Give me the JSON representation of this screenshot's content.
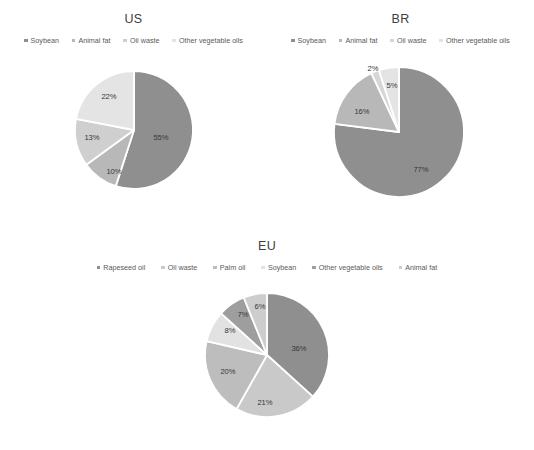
{
  "figure": {
    "background": "#ffffff",
    "palette": {
      "dark_gray": "#8f8f8f",
      "mid_gray": "#b0b0b0",
      "light_gray": "#c9c9c9",
      "lighter_gray": "#dedede",
      "lightest_gray": "#ececec",
      "pale_gray": "#bdbdbd",
      "separator": "#ffffff",
      "label_text": "#363636",
      "legend_text": "#5a5a5a",
      "title_text": "#404040"
    }
  },
  "chart_data": [
    {
      "type": "pie",
      "title": "US",
      "legend_position": "top",
      "categories": [
        "Soybean",
        "Animal fat",
        "Oil waste",
        "Other vegetable oils"
      ],
      "values": [
        55,
        10,
        13,
        22
      ],
      "labels": [
        "55%",
        "10%",
        "13%",
        "22%"
      ],
      "colors": [
        "#8f8f8f",
        "#b8b8b8",
        "#cfcfcf",
        "#e4e4e4"
      ],
      "xlabel": "",
      "ylabel": ""
    },
    {
      "type": "pie",
      "title": "BR",
      "legend_position": "top",
      "categories": [
        "Soybean",
        "Animal fat",
        "Oil waste",
        "Other vegetable oils"
      ],
      "values": [
        77,
        16,
        2,
        5
      ],
      "labels": [
        "77%",
        "16%",
        "2%",
        "5%"
      ],
      "colors": [
        "#8f8f8f",
        "#b8b8b8",
        "#d6d6d6",
        "#e4e4e4"
      ],
      "xlabel": "",
      "ylabel": ""
    },
    {
      "type": "pie",
      "title": "EU",
      "legend_position": "top",
      "categories": [
        "Rapeseed oil",
        "Oil waste",
        "Palm oil",
        "Soybean",
        "Other vegetable oils",
        "Animal fat"
      ],
      "values": [
        36,
        21,
        20,
        8,
        7,
        6
      ],
      "labels": [
        "36%",
        "21%",
        "20%",
        "8%",
        "7%",
        "6%"
      ],
      "colors": [
        "#8f8f8f",
        "#c9c9c9",
        "#bdbdbd",
        "#e2e2e2",
        "#9e9e9e",
        "#cdcdcd"
      ],
      "xlabel": "",
      "ylabel": ""
    }
  ],
  "panels": {
    "us": {
      "title": "US",
      "legend": [
        {
          "label": "Soybean",
          "color": "#8f8f8f"
        },
        {
          "label": "Animal fat",
          "color": "#b8b8b8"
        },
        {
          "label": "Oil waste",
          "color": "#cfcfcf"
        },
        {
          "label": "Other vegetable oils",
          "color": "#e4e4e4"
        }
      ],
      "slices": [
        {
          "name": "Soybean",
          "value": 55,
          "label": "55%",
          "color": "#8f8f8f",
          "label_x": 27,
          "label_y": 8
        },
        {
          "name": "Animal fat",
          "value": 10,
          "label": "10%",
          "color": "#b8b8b8",
          "label_x": -20,
          "label_y": 42
        },
        {
          "name": "Oil waste",
          "value": 13,
          "label": "13%",
          "color": "#cfcfcf",
          "label_x": -42,
          "label_y": 8
        },
        {
          "name": "Other vegetable oils",
          "value": 22,
          "label": "22%",
          "color": "#e4e4e4",
          "label_x": -25,
          "label_y": -33
        }
      ]
    },
    "br": {
      "title": "BR",
      "legend": [
        {
          "label": "Soybean",
          "color": "#8f8f8f"
        },
        {
          "label": "Animal fat",
          "color": "#b8b8b8"
        },
        {
          "label": "Oil waste",
          "color": "#d6d6d6"
        },
        {
          "label": "Other vegetable oils",
          "color": "#e4e4e4"
        }
      ],
      "slices": [
        {
          "name": "Soybean",
          "value": 77,
          "label": "77%",
          "color": "#8f8f8f",
          "label_x": 22,
          "label_y": 38
        },
        {
          "name": "Animal fat",
          "value": 16,
          "label": "16%",
          "color": "#b8b8b8",
          "label_x": -37,
          "label_y": -20
        },
        {
          "name": "Oil waste",
          "value": 2,
          "label": "2%",
          "color": "#d6d6d6",
          "label_x": -26,
          "label_y": -63
        },
        {
          "name": "Other vegetable oils",
          "value": 5,
          "label": "5%",
          "color": "#e4e4e4",
          "label_x": -7,
          "label_y": -46
        }
      ]
    },
    "eu": {
      "title": "EU",
      "legend": [
        {
          "label": "Rapeseed oil",
          "color": "#8f8f8f"
        },
        {
          "label": "Oil waste",
          "color": "#c9c9c9"
        },
        {
          "label": "Palm oil",
          "color": "#bdbdbd"
        },
        {
          "label": "Soybean",
          "color": "#e2e2e2"
        },
        {
          "label": "Other vegetable oils",
          "color": "#9e9e9e"
        },
        {
          "label": "Animal fat",
          "color": "#cdcdcd"
        }
      ],
      "slices": [
        {
          "name": "Rapeseed oil",
          "value": 36,
          "label": "36%",
          "color": "#8f8f8f",
          "label_x": 32,
          "label_y": -6
        },
        {
          "name": "Oil waste",
          "value": 21,
          "label": "21%",
          "color": "#c9c9c9",
          "label_x": -2,
          "label_y": 48
        },
        {
          "name": "Palm oil",
          "value": 20,
          "label": "20%",
          "color": "#bdbdbd",
          "label_x": -39,
          "label_y": 17
        },
        {
          "name": "Soybean",
          "value": 8,
          "label": "8%",
          "color": "#e2e2e2",
          "label_x": -37,
          "label_y": -24
        },
        {
          "name": "Other vegetable oils",
          "value": 7,
          "label": "7%",
          "color": "#9e9e9e",
          "label_x": -24,
          "label_y": -40
        },
        {
          "name": "Animal fat",
          "value": 6,
          "label": "6%",
          "color": "#cdcdcd",
          "label_x": -7,
          "label_y": -48
        }
      ]
    }
  }
}
